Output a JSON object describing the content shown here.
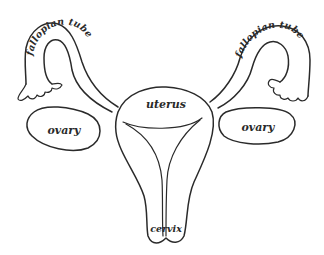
{
  "diagram": {
    "labels": {
      "left_tube": "fallopian tube",
      "right_tube": "fallopian tube",
      "uterus": "uterus",
      "left_ovary": "ovary",
      "right_ovary": "ovary",
      "cervix": "cervix"
    },
    "colors": {
      "line": "#2a2a2a",
      "background": "#ffffff"
    }
  }
}
